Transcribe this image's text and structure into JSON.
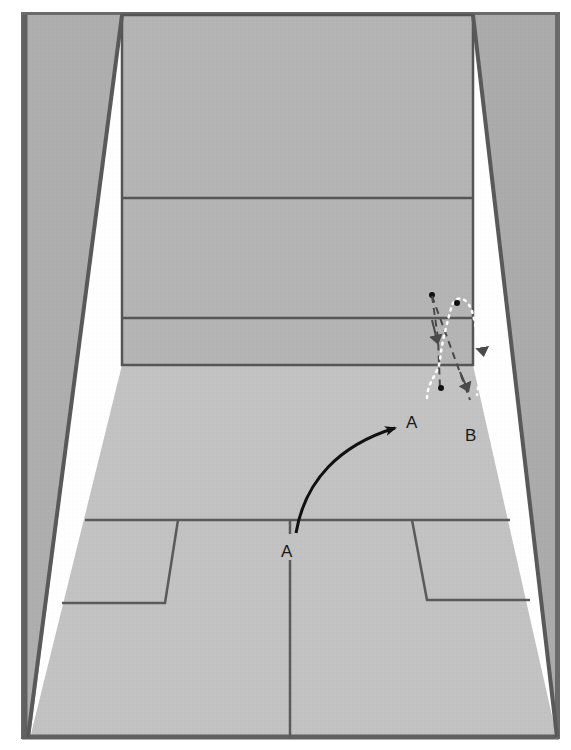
{
  "diagram": {
    "labels": {
      "start_a": "A",
      "target_a": "A",
      "target_b": "B"
    },
    "colors": {
      "background": "#ffffff",
      "side_wall": "#aeaeae",
      "front_wall": "#b4b4b4",
      "floor": "#c4c4c4",
      "lines": "#5a5a5a",
      "frame": "#606060",
      "arrow_solid": "#111111",
      "arrow_dashed": "#4a4a4a",
      "path_dotted": "#ffffff"
    },
    "shots": [
      {
        "name": "A",
        "from": "A (near T)",
        "to": "A (front right)",
        "style": "solid-curve"
      },
      {
        "name": "ball-path-1",
        "style": "dashed",
        "description": "ball hits front wall, drops down"
      },
      {
        "name": "ball-path-2",
        "style": "dashed",
        "description": "ball travels toward B"
      },
      {
        "name": "ball-path-3",
        "style": "dotted-white",
        "description": "ball bounce trajectory near right side wall"
      }
    ]
  }
}
